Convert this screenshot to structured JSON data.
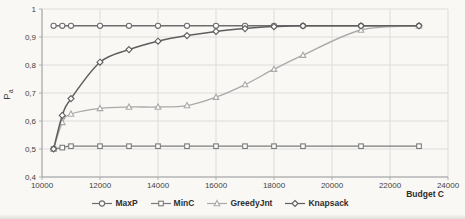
{
  "chart_data": {
    "type": "line",
    "title": "",
    "xlabel": "Budget C",
    "ylabel": "Pa",
    "ylabel_main": "P",
    "ylabel_sub": "a",
    "xlim": [
      10000,
      24000
    ],
    "ylim": [
      0.4,
      1.0
    ],
    "grid": true,
    "legend_position": "bottom-center",
    "x_ticks": [
      {
        "value": 10000,
        "label": "10000"
      },
      {
        "value": 12000,
        "label": "12000"
      },
      {
        "value": 14000,
        "label": "14000"
      },
      {
        "value": 16000,
        "label": "16000"
      },
      {
        "value": 18000,
        "label": "18000"
      },
      {
        "value": 20000,
        "label": "20000"
      },
      {
        "value": 22000,
        "label": "22000"
      },
      {
        "value": 24000,
        "label": "24000"
      }
    ],
    "y_ticks": [
      {
        "value": 1.0,
        "label": "1"
      },
      {
        "value": 0.9,
        "label": "0,9"
      },
      {
        "value": 0.8,
        "label": "0,8"
      },
      {
        "value": 0.7,
        "label": "0,7"
      },
      {
        "value": 0.6,
        "label": "0,6"
      },
      {
        "value": 0.5,
        "label": "0,5"
      },
      {
        "value": 0.4,
        "label": "0,4"
      }
    ],
    "x": [
      10400,
      10700,
      11000,
      12000,
      13000,
      14000,
      15000,
      16000,
      17000,
      18000,
      19000,
      21000,
      23000
    ],
    "series": [
      {
        "name": "MaxP",
        "marker": "circle",
        "color": "#6d6d6d",
        "line_width": 1.5,
        "values": [
          0.94,
          0.94,
          0.94,
          0.94,
          0.94,
          0.94,
          0.94,
          0.94,
          0.94,
          0.94,
          0.94,
          0.94,
          0.94
        ]
      },
      {
        "name": "MinC",
        "marker": "square",
        "color": "#7b7b7b",
        "line_width": 1.3,
        "values": [
          0.5,
          0.505,
          0.51,
          0.51,
          0.51,
          0.51,
          0.51,
          0.51,
          0.51,
          0.51,
          0.51,
          0.51,
          0.51
        ]
      },
      {
        "name": "GreedyJnt",
        "marker": "triangle",
        "color": "#a9a9a9",
        "line_width": 1.3,
        "values": [
          0.5,
          0.595,
          0.625,
          0.645,
          0.65,
          0.65,
          0.655,
          0.685,
          0.73,
          0.785,
          0.835,
          0.925,
          0.94
        ]
      },
      {
        "name": "Knapsack",
        "marker": "diamond",
        "color": "#5e5e5e",
        "line_width": 1.5,
        "values": [
          0.5,
          0.62,
          0.68,
          0.81,
          0.855,
          0.885,
          0.905,
          0.92,
          0.93,
          0.937,
          0.94,
          0.94,
          0.94
        ]
      }
    ]
  },
  "colors": {
    "background": "#f9f8f5",
    "grid": "#dcdcdc",
    "axis": "#a0a0a0",
    "text": "#3f3f3f",
    "legend_text": "#2e2e2e",
    "marker_fill": "#fcfcfc"
  }
}
